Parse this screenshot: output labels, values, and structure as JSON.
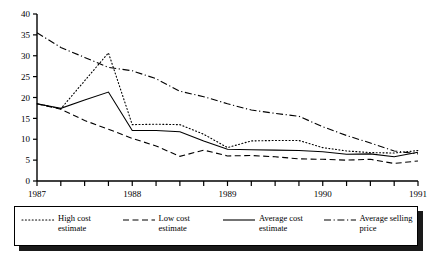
{
  "chart_data": {
    "type": "line",
    "title": "",
    "xlabel": "",
    "ylabel": "",
    "ylim": [
      0,
      40
    ],
    "yticks": [
      0,
      5,
      10,
      15,
      20,
      25,
      30,
      35,
      40
    ],
    "grid": false,
    "legend_position": "below",
    "x": [
      "1987 Q1",
      "1987 Q2",
      "1987 Q3",
      "1987 Q4",
      "1988 Q1",
      "1988 Q2",
      "1988 Q3",
      "1988 Q4",
      "1989 Q1",
      "1989 Q2",
      "1989 Q3",
      "1989 Q4",
      "1990 Q1",
      "1990 Q2",
      "1990 Q3",
      "1990 Q4",
      "1991 Q1"
    ],
    "xtick_labels": [
      "1987",
      "1988",
      "1989",
      "1990",
      "1991"
    ],
    "xtick_positions": [
      0,
      4,
      8,
      12,
      16
    ],
    "series": [
      {
        "name": "High cost estimate",
        "style": "dotted",
        "values": [
          18.5,
          17.3,
          24.0,
          30.7,
          13.5,
          13.6,
          13.5,
          11.2,
          8.0,
          9.6,
          9.7,
          9.7,
          8.0,
          7.2,
          6.8,
          6.7,
          7.3
        ]
      },
      {
        "name": "Low cost estimate",
        "style": "dashed",
        "values": [
          18.5,
          17.2,
          14.5,
          12.4,
          10.2,
          8.4,
          5.9,
          7.4,
          6.0,
          6.1,
          5.8,
          5.3,
          5.2,
          5.0,
          5.2,
          4.2,
          4.8
        ]
      },
      {
        "name": "Average cost estimate",
        "style": "solid",
        "values": [
          18.5,
          17.4,
          19.4,
          21.3,
          12.1,
          12.1,
          11.8,
          9.6,
          7.6,
          7.5,
          7.4,
          7.3,
          7.0,
          6.4,
          6.5,
          5.8,
          6.9
        ]
      },
      {
        "name": "Average selling price",
        "style": "dashdot",
        "values": [
          35.5,
          32.0,
          29.6,
          27.2,
          26.4,
          24.5,
          21.5,
          20.2,
          18.5,
          17.0,
          16.2,
          15.5,
          13.0,
          10.9,
          9.1,
          7.2,
          6.5
        ]
      }
    ]
  },
  "legend": {
    "items": [
      {
        "label": "High cost\nestimate",
        "style": "dotted"
      },
      {
        "label": "Low cost\nestimate",
        "style": "dashed"
      },
      {
        "label": "Average cost\nestimate",
        "style": "solid"
      },
      {
        "label": "Average selling\nprice",
        "style": "dashdot"
      }
    ]
  },
  "colors": {
    "line": "#000000",
    "axis": "#000000",
    "background": "#ffffff",
    "legend_shadow": "#1a1a1a"
  }
}
